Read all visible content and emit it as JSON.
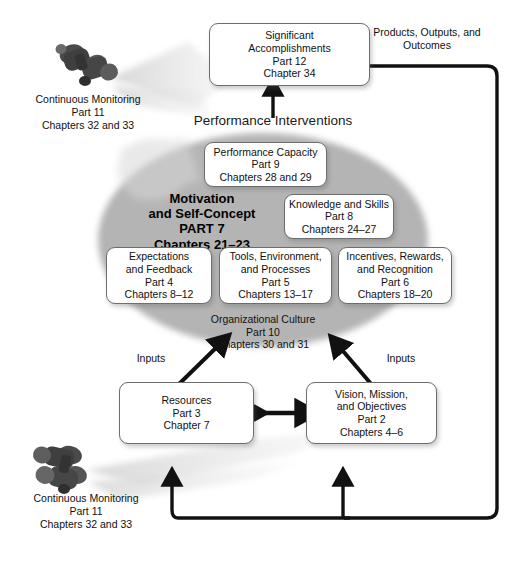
{
  "diagram": {
    "title_interventions": "Performance Interventions",
    "label_products": "Products, Outputs, and\nOutcomes",
    "products_line1": "Products, Outputs, and",
    "products_line2": "Outcomes",
    "inputs_left": "Inputs",
    "inputs_right": "Inputs"
  },
  "nodes": {
    "accomplishments": {
      "name": "Significant Accomplishments",
      "l1": "Significant",
      "l2": "Accomplishments",
      "l3": "Part 12",
      "l4": "Chapter 34"
    },
    "performance_capacity": {
      "name": "Performance Capacity",
      "l1": "Performance Capacity",
      "l2": "Part 9",
      "l3": "Chapters 28 and 29"
    },
    "motivation": {
      "name": "Motivation and Self-Concept",
      "l1": "Motivation",
      "l2": "and Self-Concept",
      "l3": "PART 7",
      "l4": "Chapters 21–23"
    },
    "knowledge": {
      "name": "Knowledge and Skills",
      "l1": "Knowledge and Skills",
      "l2": "Part 8",
      "l3": "Chapters 24–27"
    },
    "expectations": {
      "name": "Expectations and Feedback",
      "l1": "Expectations",
      "l2": "and Feedback",
      "l3": "Part 4",
      "l4": "Chapters 8–12"
    },
    "tools": {
      "name": "Tools, Environment, and Processes",
      "l1": "Tools, Environment,",
      "l2": "and Processes",
      "l3": "Part 5",
      "l4": "Chapters 13–17"
    },
    "incentives": {
      "name": "Incentives, Rewards, and Recognition",
      "l1": "Incentives, Rewards,",
      "l2": "and Recognition",
      "l3": "Part 6",
      "l4": "Chapters 18–20"
    },
    "org_culture": {
      "name": "Organizational Culture",
      "l1": "Organizational Culture",
      "l2": "Part 10",
      "l3": "Chapters 30 and 31"
    },
    "resources": {
      "name": "Resources",
      "l1": "Resources",
      "l2": "Part 3",
      "l3": "Chapter 7"
    },
    "vision": {
      "name": "Vision, Mission, and Objectives",
      "l1": "Vision, Mission,",
      "l2": "and Objectives",
      "l3": "Part 2",
      "l4": "Chapters 4–6"
    }
  },
  "monitoring_top": {
    "l1": "Continuous Monitoring",
    "l2": "Part 11",
    "l3": "Chapters 32 and 33"
  },
  "monitoring_bottom": {
    "l1": "Continuous Monitoring",
    "l2": "Part 11",
    "l3": "Chapters 32 and 33"
  },
  "colors": {
    "ellipse": "#b3b3b3",
    "beam": "#dcdcdc",
    "arrow": "#111111",
    "box_border": "#6d6d6d",
    "text": "#111111"
  }
}
